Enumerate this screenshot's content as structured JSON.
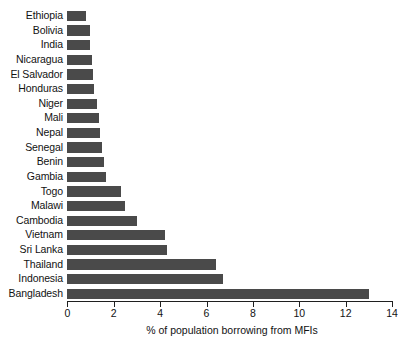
{
  "chart_data": {
    "type": "bar",
    "orientation": "horizontal",
    "title": "",
    "xlabel": "% of population borrowing from MFIs",
    "ylabel": "",
    "xlim": [
      0,
      14
    ],
    "xticks": [
      0,
      2,
      4,
      6,
      8,
      10,
      12,
      14
    ],
    "grid": false,
    "legend": null,
    "bar_color": "#4a4a4a",
    "categories": [
      "Ethiopia",
      "Bolivia",
      "India",
      "Nicaragua",
      "El Salvador",
      "Honduras",
      "Niger",
      "Mali",
      "Nepal",
      "Senegal",
      "Benin",
      "Gambia",
      "Togo",
      "Malawi",
      "Cambodia",
      "Vietnam",
      "Sri Lanka",
      "Thailand",
      "Indonesia",
      "Bangladesh"
    ],
    "values": [
      0.8,
      1.0,
      1.0,
      1.05,
      1.1,
      1.15,
      1.3,
      1.35,
      1.4,
      1.5,
      1.6,
      1.65,
      2.3,
      2.5,
      3.0,
      4.2,
      4.3,
      6.4,
      6.7,
      13.0
    ]
  }
}
